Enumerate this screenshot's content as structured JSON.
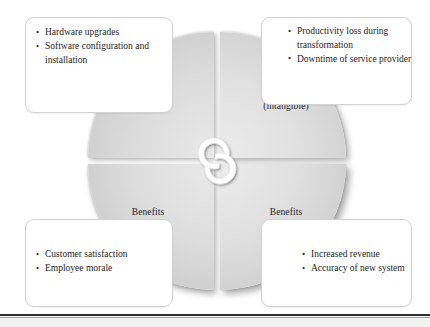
{
  "diagram": {
    "type": "four-quadrant-cycle",
    "center_icon": "recycle-arrows-icon",
    "quadrants": [
      {
        "id": "costs-tangible",
        "position": "top-left",
        "title": "Costs",
        "subtitle": "(tangible)",
        "bullets": [
          "Hardware upgrades",
          "Software configuration and installation"
        ]
      },
      {
        "id": "costs-intangible",
        "position": "top-right",
        "title": "Costs",
        "subtitle": "(intangible)",
        "bullets": [
          "Productivity loss during transformation",
          "Downtime of service provider"
        ]
      },
      {
        "id": "benefits-intangible",
        "position": "bottom-left",
        "title": "Benefits",
        "subtitle": "(intangible)",
        "bullets": [
          "Customer satisfaction",
          "Employee morale"
        ]
      },
      {
        "id": "benefits-tangible",
        "position": "bottom-right",
        "title": "Benefits",
        "subtitle": "(tangible)",
        "bullets": [
          "Increased revenue",
          "Accuracy of new system"
        ]
      }
    ],
    "colors": {
      "quadrant_light": "#ececec",
      "quadrant_dark": "#bcbcbc",
      "callout_border": "#d2d2d2",
      "text": "#1d1d1d",
      "rule": "#2e2e2e",
      "hub_arrow": "#ffffff"
    }
  }
}
